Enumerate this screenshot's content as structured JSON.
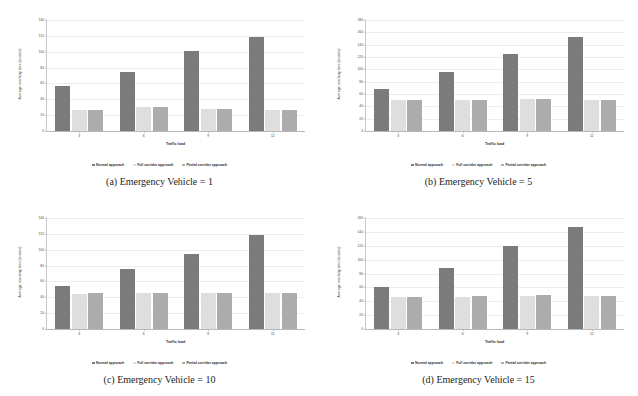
{
  "figure": {
    "panels": [
      {
        "caption": "(a) Emergency Vehicle = 1",
        "chart_data": {
          "type": "bar",
          "title": "",
          "xlabel": "Traffic load",
          "ylabel": "Average reaching time (in units)",
          "categories": [
            "3",
            "6",
            "9",
            "12"
          ],
          "yticks": [
            0,
            20,
            40,
            60,
            80,
            100,
            120,
            140
          ],
          "ylim": [
            0,
            140
          ],
          "grid": true,
          "legend_position": "bottom",
          "series": [
            {
              "name": "Normal approach",
              "color": "#7b7b7b",
              "values": [
                57,
                75,
                101,
                119
              ]
            },
            {
              "name": "Full corridor approach",
              "color": "#dedede",
              "values": [
                26,
                30,
                28,
                27
              ]
            },
            {
              "name": "Partial corridor approach",
              "color": "#acacac",
              "values": [
                26,
                30,
                28,
                27
              ]
            }
          ]
        }
      },
      {
        "caption": "(b) Emergency Vehicle = 5",
        "chart_data": {
          "type": "bar",
          "title": "",
          "xlabel": "Traffic load",
          "ylabel": "Average reaching time (in units)",
          "categories": [
            "3",
            "6",
            "9",
            "12"
          ],
          "yticks": [
            0,
            20,
            40,
            60,
            80,
            100,
            120,
            140,
            160,
            180
          ],
          "ylim": [
            0,
            180
          ],
          "grid": true,
          "legend_position": "bottom",
          "series": [
            {
              "name": "Normal approach",
              "color": "#7b7b7b",
              "values": [
                68,
                96,
                125,
                153
              ]
            },
            {
              "name": "Full corridor approach",
              "color": "#dedede",
              "values": [
                50,
                50,
                52,
                51
              ]
            },
            {
              "name": "Partial corridor approach",
              "color": "#acacac",
              "values": [
                50,
                50,
                52,
                51
              ]
            }
          ]
        }
      },
      {
        "caption": "(c) Emergency Vehicle = 10",
        "chart_data": {
          "type": "bar",
          "title": "",
          "xlabel": "Traffic load",
          "ylabel": "Average reaching time (in units)",
          "categories": [
            "3",
            "6",
            "9",
            "12"
          ],
          "yticks": [
            0,
            20,
            40,
            60,
            80,
            100,
            120,
            140
          ],
          "ylim": [
            0,
            140
          ],
          "grid": true,
          "legend_position": "bottom",
          "series": [
            {
              "name": "Normal approach",
              "color": "#7b7b7b",
              "values": [
                54,
                76,
                95,
                118
              ]
            },
            {
              "name": "Full corridor approach",
              "color": "#dedede",
              "values": [
                44,
                45,
                45,
                45
              ]
            },
            {
              "name": "Partial corridor approach",
              "color": "#acacac",
              "values": [
                45,
                45,
                46,
                45
              ]
            }
          ]
        }
      },
      {
        "caption": "(d) Emergency Vehicle = 15",
        "chart_data": {
          "type": "bar",
          "title": "",
          "xlabel": "Traffic load",
          "ylabel": "Average reaching time (in units)",
          "categories": [
            "3",
            "6",
            "9",
            "12"
          ],
          "yticks": [
            0,
            20,
            40,
            60,
            80,
            100,
            120,
            140,
            160
          ],
          "ylim": [
            0,
            160
          ],
          "grid": true,
          "legend_position": "bottom",
          "series": [
            {
              "name": "Normal approach",
              "color": "#7b7b7b",
              "values": [
                61,
                88,
                119,
                147
              ]
            },
            {
              "name": "Full corridor approach",
              "color": "#dedede",
              "values": [
                46,
                46,
                48,
                48
              ]
            },
            {
              "name": "Partial corridor approach",
              "color": "#acacac",
              "values": [
                46,
                47,
                49,
                48
              ]
            }
          ]
        }
      }
    ]
  }
}
